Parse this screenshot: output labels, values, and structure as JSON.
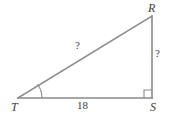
{
  "figure": {
    "type": "right-triangle-geometry-diagram",
    "background_color": "#ffffff",
    "stroke_color": "#8a8a8a",
    "text_color": "#3d3d3d",
    "vertices": [
      {
        "id": "R",
        "label": "R",
        "x": 152,
        "y": 16,
        "position": "top-right"
      },
      {
        "id": "S",
        "label": "S",
        "x": 152,
        "y": 98,
        "position": "bottom-right"
      },
      {
        "id": "T",
        "label": "T",
        "x": 18,
        "y": 98,
        "position": "bottom-left"
      }
    ],
    "sides": [
      {
        "id": "TS",
        "name": "base-leg",
        "label": "18",
        "from": "T",
        "to": "S",
        "known": true
      },
      {
        "id": "RS",
        "name": "vertical-leg",
        "label": "?",
        "from": "R",
        "to": "S",
        "known": false
      },
      {
        "id": "TR",
        "name": "hypotenuse",
        "label": "?",
        "from": "T",
        "to": "R",
        "known": false
      }
    ],
    "markers": [
      {
        "id": "angle-T",
        "type": "angle-arc",
        "at": "T",
        "radius": 24
      },
      {
        "id": "angle-S",
        "type": "right-angle-square",
        "at": "S",
        "size": 8
      }
    ]
  }
}
